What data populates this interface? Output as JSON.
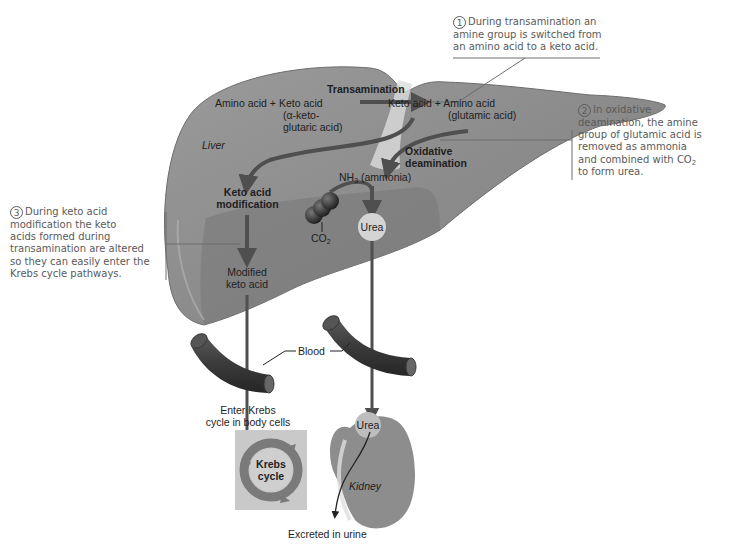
{
  "colors": {
    "liver_fill": "#8e8e8e",
    "liver_dark": "#6f6f6f",
    "arrow": "#4f4f4f",
    "callout_text": "#5a5a5a",
    "background": "#ffffff"
  },
  "callouts": {
    "one": {
      "number": "1",
      "lines": [
        "During transamination an",
        "amine group is switched from",
        "an amino acid to a keto acid."
      ]
    },
    "two": {
      "number": "2",
      "lines": [
        "In oxidative",
        "deamination, the amine",
        "group of glutamic acid is",
        "removed as ammonia",
        "and combined with CO",
        "to form urea."
      ],
      "co2_sub": "2"
    },
    "three": {
      "number": "3",
      "lines": [
        "During keto acid",
        "modification the keto",
        "acids formed during",
        "transamination are altered",
        "so they can easily enter the",
        "Krebs cycle pathways."
      ]
    }
  },
  "labels": {
    "transamination": "Transamination",
    "reactants": "Amino acid + Keto acid",
    "reactant_note_1": "(α-keto-",
    "reactant_note_2": "glutaric acid)",
    "products": "Keto acid + Amino acid",
    "product_note": "(glutamic acid)",
    "liver": "Liver",
    "oxidative_1": "Oxidative",
    "oxidative_2": "deamination",
    "nh3": "NH",
    "nh3_sub": "3",
    "ammonia": " (ammonia)",
    "keto_mod_1": "Keto acid",
    "keto_mod_2": "modification",
    "co2": "CO",
    "co2_sub": "2",
    "urea_liver": "Urea",
    "modified_1": "Modified",
    "modified_2": "keto acid",
    "blood": "Blood",
    "enter_1": "Enter Krebs",
    "enter_2": "cycle in body cells",
    "krebs_1": "Krebs",
    "krebs_2": "cycle",
    "urea_kidney": "Urea",
    "kidney": "Kidney",
    "excreted": "Excreted in urine"
  }
}
